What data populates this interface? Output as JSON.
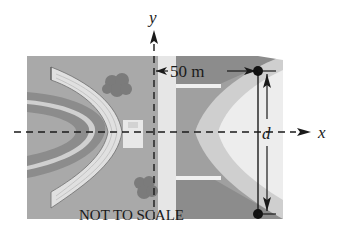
{
  "diagram": {
    "axes": {
      "x_label": "x",
      "y_label": "y"
    },
    "dimensions": {
      "horizontal_distance_label": "50 m",
      "vertical_distance_label": "d"
    },
    "note": "NOT TO SCALE",
    "colors": {
      "background": "#ffffff",
      "dark_gray": "#8c8c8c",
      "mid_gray": "#a9a9a9",
      "light_gray": "#d6d6d6",
      "very_light": "#ececec",
      "shrub": "#7b7b7b",
      "ink": "#1a1a1a"
    }
  }
}
